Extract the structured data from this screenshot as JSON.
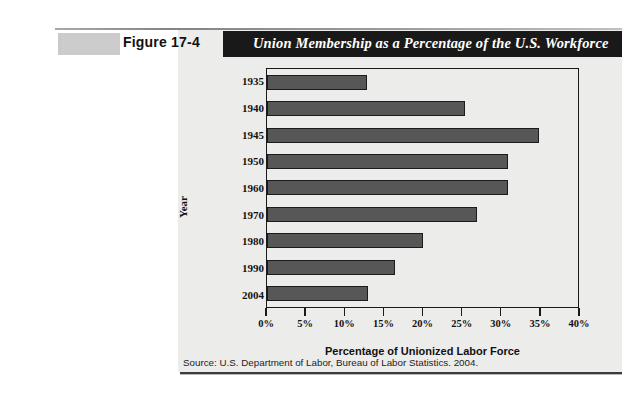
{
  "figure": {
    "number_label": "Figure 17-4",
    "title": "Union Membership as a Percentage of the U.S. Workforce",
    "source": "Source: U.S. Department of Labor, Bureau of Labor Statistics. 2004.",
    "colors": {
      "title_bar": "#191919",
      "title_text": "#ffffff",
      "panel_bg": "#ececeb",
      "bar_fill": "#575757",
      "bar_outline": "#1b1b1b",
      "axis": "#1a1a1a",
      "swatch": "#c9c9c9"
    }
  },
  "chart_data": {
    "type": "bar",
    "orientation": "horizontal",
    "title": "Union Membership as a Percentage of the U.S. Workforce",
    "categories": [
      "1935",
      "1940",
      "1945",
      "1950",
      "1960",
      "1970",
      "1980",
      "1990",
      "2004"
    ],
    "values": [
      12.8,
      25.5,
      35.0,
      31.0,
      31.0,
      27.0,
      20.0,
      16.5,
      13.0
    ],
    "xlabel": "Percentage of Unionized Labor Force",
    "ylabel": "Year",
    "xlim": [
      0,
      40
    ],
    "xticks": [
      0,
      5,
      10,
      15,
      20,
      25,
      30,
      35,
      40
    ],
    "xticklabels": [
      "0%",
      "5%",
      "10%",
      "15%",
      "20%",
      "25%",
      "30%",
      "35%",
      "40%"
    ],
    "grid": false,
    "legend": null
  }
}
